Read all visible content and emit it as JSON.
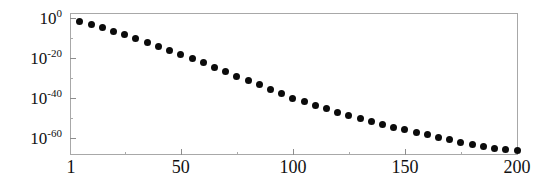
{
  "chart_data": {
    "type": "scatter",
    "title": "",
    "subtitle": "",
    "xlabel": "",
    "ylabel": "",
    "yscale": "log",
    "xscale": "linear",
    "xlim": [
      1,
      200
    ],
    "ylim": [
      1e-68,
      1.0
    ],
    "grid": false,
    "legend": null,
    "marker": "filled-circle",
    "marker_color": "#0b0b0b",
    "frame_color": "#a8a8a8",
    "x_ticks": [
      {
        "value": 1,
        "label": "1"
      },
      {
        "value": 50,
        "label": "50"
      },
      {
        "value": 100,
        "label": "100"
      },
      {
        "value": 150,
        "label": "150"
      },
      {
        "value": 200,
        "label": "200"
      }
    ],
    "y_ticks": [
      {
        "value": 1.0,
        "mantissa": "10",
        "exponent": "0",
        "label": "10^0"
      },
      {
        "value": 1e-20,
        "mantissa": "10",
        "exponent": "-20",
        "label": "10^-20"
      },
      {
        "value": 1e-40,
        "mantissa": "10",
        "exponent": "-40",
        "label": "10^-40"
      },
      {
        "value": 1e-60,
        "mantissa": "10",
        "exponent": "-60",
        "label": "10^-60"
      }
    ],
    "x": [
      5,
      10,
      15,
      20,
      25,
      30,
      35,
      40,
      45,
      50,
      55,
      60,
      65,
      70,
      75,
      80,
      85,
      90,
      95,
      100,
      105,
      110,
      115,
      120,
      125,
      130,
      135,
      140,
      145,
      150,
      155,
      160,
      165,
      170,
      175,
      180,
      185,
      190,
      195,
      200
    ],
    "y_log10": [
      -1.6,
      -3.2,
      -4.9,
      -6.6,
      -8.4,
      -10.3,
      -12.2,
      -14.2,
      -16.2,
      -18.2,
      -20.3,
      -22.4,
      -24.6,
      -26.8,
      -29.0,
      -31.2,
      -33.4,
      -35.6,
      -37.8,
      -40.0,
      -41.9,
      -43.7,
      -45.4,
      -47.1,
      -48.7,
      -50.2,
      -51.7,
      -53.1,
      -54.5,
      -55.8,
      -57.1,
      -58.4,
      -59.6,
      -60.8,
      -62.0,
      -63.1,
      -64.1,
      -65.0,
      -65.6,
      -66.0
    ],
    "y": [
      0.025,
      0.00063,
      1.3e-05,
      2.5e-07,
      4e-09,
      5e-11,
      6.3e-13,
      6.3e-15,
      6.3e-17,
      6.3e-19,
      5e-21,
      4e-23,
      2.5e-25,
      1.6e-27,
      1e-29,
      6.3e-32,
      4e-34,
      2.5e-36,
      1.6e-38,
      1e-40,
      1.3e-42,
      2e-44,
      4e-46,
      7.9e-48,
      2e-49,
      6.3e-51,
      2e-52,
      7.9e-54,
      3.2e-55,
      1.6e-56,
      7.9e-58,
      4e-59,
      2.5e-60,
      1.6e-61,
      1e-62,
      7.9e-64,
      7.9e-65,
      1e-65,
      2.5e-66,
      1e-66
    ]
  },
  "axes": {
    "y_axis_top_decade": 2.0,
    "y_axis_bottom_decade": -68.0,
    "x_axis_min": 1,
    "x_axis_max": 200
  }
}
